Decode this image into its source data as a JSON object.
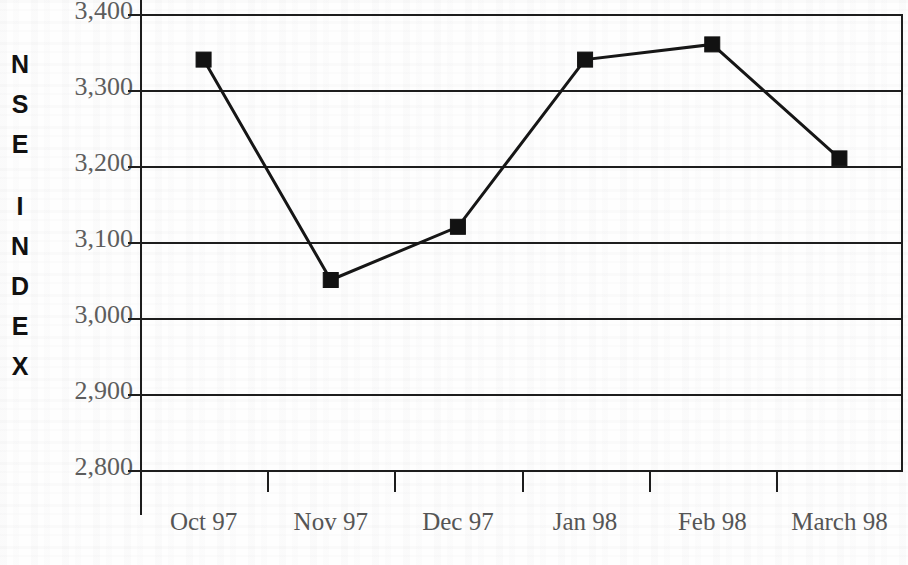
{
  "chart_data": {
    "type": "line",
    "title": "",
    "subtitle": "",
    "xlabel": "",
    "ylabel": "N S E   I N D E X",
    "ylabel_letters": [
      "N",
      "S",
      "E",
      "I",
      "N",
      "D",
      "E",
      "X"
    ],
    "categories": [
      "Oct 97",
      "Nov 97",
      "Dec 97",
      "Jan 98",
      "Feb 98",
      "March 98"
    ],
    "values": [
      3340,
      3050,
      3120,
      3340,
      3360,
      3210
    ],
    "series": [
      {
        "name": "NSE Index",
        "values": [
          3340,
          3050,
          3120,
          3340,
          3360,
          3210
        ]
      }
    ],
    "ylim": [
      2800,
      3400
    ],
    "ytick_values": [
      3400,
      3300,
      3200,
      3100,
      3000,
      2900,
      2800
    ],
    "ytick_labels": [
      "3,400",
      "3,300",
      "3,200",
      "3,100",
      "3,000",
      "2,900",
      "2,800"
    ],
    "grid": true,
    "grid_axis": "y",
    "legend": false,
    "legend_position": "none",
    "marker": "square",
    "line_color": "#161616",
    "marker_color": "#121212",
    "grid_color": "#1d1d1d",
    "tick_label_color": "#555555",
    "axis_title_color": "#111111",
    "background_color": "#fefefe"
  }
}
